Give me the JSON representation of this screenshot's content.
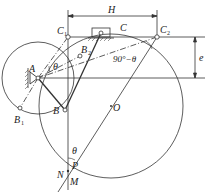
{
  "diagram": {
    "type": "crank-slider mechanism design diagram",
    "points": {
      "A": {
        "label": "A",
        "x": 38,
        "y": 78
      },
      "B": {
        "label": "B",
        "x": 65,
        "y": 110
      },
      "B1": {
        "label": "B",
        "sub": "1",
        "x": 20,
        "y": 108
      },
      "B2": {
        "label": "B",
        "sub": "2",
        "x": 80,
        "y": 56
      },
      "C": {
        "label": "C",
        "x": 101,
        "y": 34
      },
      "C1": {
        "label": "C",
        "sub": "1",
        "x": 68,
        "y": 37
      },
      "C2": {
        "label": "C",
        "sub": "2",
        "x": 157,
        "y": 37
      },
      "O": {
        "label": "O",
        "x": 111,
        "y": 106
      },
      "P": {
        "label": "P",
        "x": 68,
        "y": 171
      },
      "N": {
        "label": "N",
        "x": 68,
        "y": 171
      },
      "M": {
        "label": "M",
        "x": 68,
        "y": 171
      }
    },
    "dimensions": {
      "stroke": "H",
      "offset": "e"
    },
    "angles": {
      "theta_at_A": "θ",
      "angle_at_C2": "90°−θ",
      "theta_at_P": "θ"
    },
    "colors": {
      "line": "#333333",
      "background": "#ffffff"
    }
  }
}
